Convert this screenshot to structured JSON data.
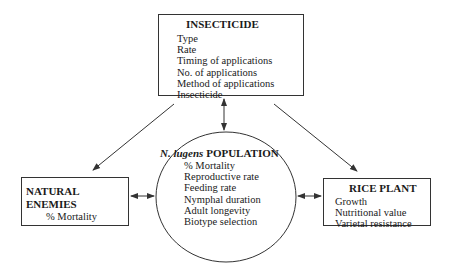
{
  "insecticide": {
    "title": "INSECTICIDE",
    "items": [
      "Type",
      "Rate",
      "Timing of applications",
      "No. of applications",
      "Method of applications",
      "Insecticide"
    ]
  },
  "natural_enemies": {
    "title": "NATURAL ENEMIES",
    "items": [
      "% Mortality"
    ]
  },
  "population": {
    "title_italic": "N. lugens",
    "title_rest": " POPULATION",
    "items": [
      "% Mortality",
      "Reproductive rate",
      "Feeding rate",
      "Nymphal duration",
      "Adult longevity",
      "Biotype selection"
    ]
  },
  "rice_plant": {
    "title": "RICE PLANT",
    "items": [
      "Growth",
      "Nutritional value",
      "Varietal resistance"
    ]
  },
  "colors": {
    "line": "#333333",
    "background": "#ffffff"
  }
}
